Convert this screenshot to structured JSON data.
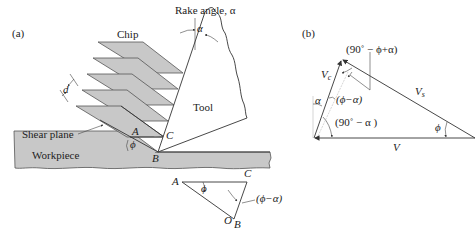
{
  "figure": {
    "panel_a": {
      "label": "(a)",
      "chip_label": "Chip",
      "tool_label": "Tool",
      "rake_angle_label": "Rake angle, α",
      "rake_alpha": "α",
      "shear_plane_label": "Shear plane",
      "workpiece_label": "Workpiece",
      "d_label": "d",
      "point_A": "A",
      "point_B": "B",
      "point_C": "C",
      "phi": "ϕ",
      "inset": {
        "point_A": "A",
        "point_B": "B",
        "point_C": "C",
        "point_O": "O",
        "phi": "ϕ",
        "angle_label": "(ϕ−α)"
      }
    },
    "panel_b": {
      "label": "(b)",
      "vc_label": "V",
      "vc_sub": "c",
      "vs_label": "V",
      "vs_sub": "s",
      "v_label": "V",
      "top_angle": "(90˚ − ϕ+α)",
      "alpha": "α",
      "phi_minus_alpha": "(ϕ−α)",
      "ninety_minus_alpha": "(90˚ − α )",
      "phi": "ϕ"
    }
  }
}
